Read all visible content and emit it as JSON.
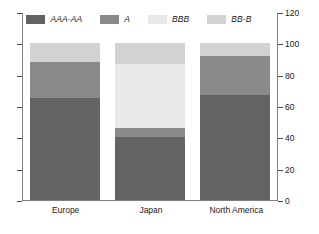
{
  "chart_data": {
    "type": "bar",
    "stacked": true,
    "title": "",
    "xlabel": "",
    "ylabel": "",
    "categories": [
      "Europe",
      "Japan",
      "North America"
    ],
    "series": [
      {
        "name": "AAA-AA",
        "color": "#636363",
        "values": [
          65,
          40,
          67
        ]
      },
      {
        "name": "A",
        "color": "#8a8a8a",
        "values": [
          23,
          6,
          25
        ]
      },
      {
        "name": "BBB",
        "color": "#e8e8e8",
        "values": [
          0,
          41,
          0
        ]
      },
      {
        "name": "BB-B",
        "color": "#d2d2d2",
        "values": [
          12,
          13,
          8
        ]
      }
    ],
    "ylim": [
      0,
      120
    ],
    "yticks": [
      0,
      20,
      40,
      60,
      80,
      100,
      120
    ],
    "ytick_labels": [
      "0",
      "20",
      "40",
      "60",
      "80",
      "100",
      "120"
    ],
    "y_axis_position": "right",
    "left_axis_ticks_labeled": false,
    "grid": false,
    "legend_position": "top"
  },
  "legend": {
    "items": [
      {
        "label": "AAA-AA",
        "swatch": "legend-swatch-aaa-aa"
      },
      {
        "label": "A",
        "swatch": "legend-swatch-a"
      },
      {
        "label": "BBB",
        "swatch": "legend-swatch-bbb"
      },
      {
        "label": "BB-B",
        "swatch": "legend-swatch-bb-b"
      }
    ]
  },
  "axis": {
    "right_labels": [
      "120",
      "100",
      "80",
      "60",
      "40",
      "20",
      "0"
    ]
  },
  "categories": {
    "label_0": "Europe",
    "label_1": "Japan",
    "label_2": "North America"
  }
}
